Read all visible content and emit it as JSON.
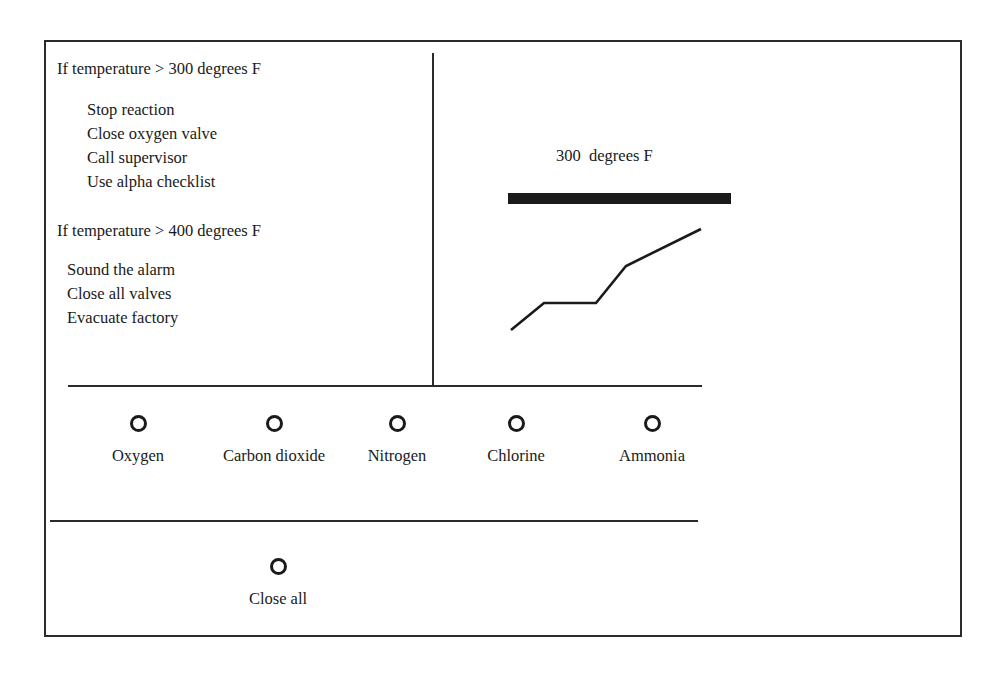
{
  "panel": {
    "rule_blocks": [
      {
        "heading": "If temperature > 300 degrees F",
        "actions": [
          "Stop reaction",
          "Close oxygen valve",
          "Call supervisor",
          "Use alpha checklist"
        ]
      },
      {
        "heading": "If temperature > 400 degrees F",
        "actions": [
          "Sound the alarm",
          "Close all valves",
          "Evacuate factory"
        ]
      }
    ]
  },
  "chart_data": {
    "type": "line",
    "title": "300  degrees F",
    "xlabel": "",
    "ylabel": "",
    "threshold_label": "300  degrees F",
    "threshold_value": 300,
    "xlim": [
      0,
      500
    ],
    "ylim": [
      0,
      330
    ],
    "grid": false,
    "legend": "none",
    "series": [
      {
        "name": "temperature",
        "kind": "polyline",
        "points": [
          [
            65,
            278
          ],
          [
            98,
            251
          ],
          [
            150,
            251
          ],
          [
            180,
            214
          ],
          [
            255,
            177
          ]
        ]
      },
      {
        "name": "threshold-bar",
        "kind": "bar",
        "x0": 62,
        "x1": 285,
        "y": 141,
        "thickness": 11,
        "color": "#1a1a1a"
      }
    ]
  },
  "gas_valves": {
    "options": [
      {
        "label": "Oxygen",
        "left": 32,
        "selected": false
      },
      {
        "label": "Carbon dioxide",
        "left": 168,
        "selected": false
      },
      {
        "label": "Nitrogen",
        "left": 291,
        "selected": false
      },
      {
        "label": "Chlorine",
        "left": 410,
        "selected": false
      },
      {
        "label": "Ammonia",
        "left": 546,
        "selected": false
      }
    ]
  },
  "close_all": {
    "label": "Close all",
    "selected": false
  },
  "colors": {
    "ink": "#1a1a1a",
    "border": "#2b2b2b",
    "background": "#ffffff"
  }
}
